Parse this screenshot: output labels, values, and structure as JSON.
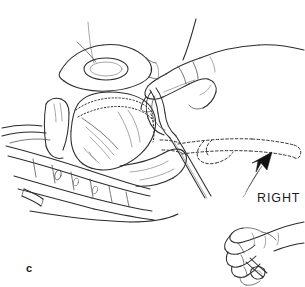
{
  "figure": {
    "panel_label": "c",
    "direction_label": "RIGHT",
    "background_color": "#ffffff",
    "ink_color": "#2b2b2b",
    "arrow_color": "#111111",
    "width": 305,
    "height": 287
  },
  "annotations": {
    "direction_arrow": {
      "label": "RIGHT",
      "style": "solid-filled-curved-arrow",
      "points_to": "dashed-target-tube"
    },
    "target_outline": {
      "style": "dashed",
      "meaning": "intended-final-position-of-tube"
    },
    "internal_outline": {
      "style": "dotted",
      "meaning": "hidden-anatomical-border"
    }
  },
  "parts": {
    "upper_hand": "upper-hand-forearm",
    "lower_hand": "lower-hand-gripping-tube",
    "organ": "heart-outline",
    "ribs": "rib-cage-and-cartilage",
    "vessels": "great-vessels",
    "tube": "catheter-tube"
  }
}
